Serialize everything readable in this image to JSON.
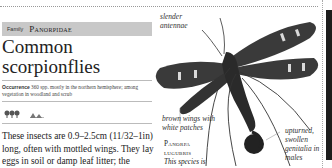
{
  "header": {
    "family_label": "Family",
    "family_name": "Panorpidae",
    "title": "Common scorpionflies"
  },
  "occurrence": {
    "label": "Occurrence",
    "text": "360 spp. mostly in the northern hemisphere; among vegetation in woodland and scrub"
  },
  "habitat_icons": [
    "woodland-icon",
    "scrub-icon"
  ],
  "body_text": "These insects are 0.9–2.5cm (11/32–1in) long, often with mottled wings. They lay eggs in soil or damp leaf litter; the",
  "illustration": {
    "captions": {
      "antennae": "slender antennae",
      "wings": "brown wings with white patches",
      "genitalia": "upturned, swollen genitalia in males"
    },
    "species": {
      "name_line1": "Panorpa",
      "name_line2": "lugubris",
      "description": "This species is"
    }
  },
  "colors": {
    "family_bar": "#c8c8c8",
    "text": "#222222",
    "insect_dark": "#2a2a2a",
    "wing_patch": "#d9d9d9"
  }
}
